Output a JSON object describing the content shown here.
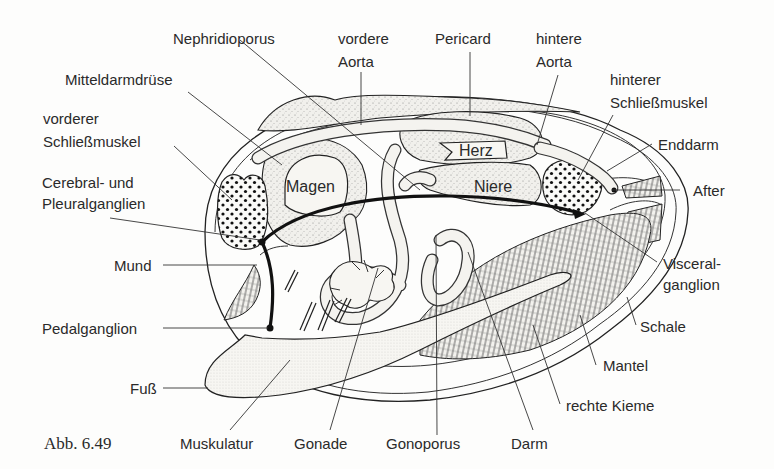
{
  "figure": {
    "caption": "Abb. 6.49",
    "labels": {
      "nephridioporus": "Nephridioporus",
      "vordere_aorta_1": "vordere",
      "vordere_aorta_2": "Aorta",
      "pericard": "Pericard",
      "hintere_aorta_1": "hintere",
      "hintere_aorta_2": "Aorta",
      "mitteldarmdruese": "Mitteldarmdrüse",
      "hinterer_schliessmuskel_1": "hinterer",
      "hinterer_schliessmuskel_2": "Schließmuskel",
      "vorderer_schliessmuskel_1": "vorderer",
      "vorderer_schliessmuskel_2": "Schließmuskel",
      "enddarm": "Enddarm",
      "herz": "Herz",
      "magen": "Magen",
      "niere": "Niere",
      "after": "After",
      "cerebral_1": "Cerebral- und",
      "cerebral_2": "Pleuralganglien",
      "mund": "Mund",
      "visceral_1": "Visceral-",
      "visceral_2": "ganglion",
      "pedalganglion": "Pedalganglion",
      "schale": "Schale",
      "mantel": "Mantel",
      "fuss": "Fuß",
      "rechte_kieme": "rechte Kieme",
      "muskulatur": "Muskulatur",
      "gonade": "Gonade",
      "gonoporus": "Gonoporus",
      "darm": "Darm"
    },
    "colors": {
      "ink": "#222222",
      "paper": "#fdfdfc",
      "organ_fill": "#efeee9"
    }
  }
}
